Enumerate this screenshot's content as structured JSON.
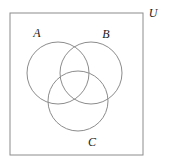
{
  "figure": {
    "kind": "venn-diagram",
    "background_color": "#ffffff",
    "stroke_color": "#8c8c8c",
    "label_color": "#1a1a1a",
    "stroke_width": 1
  },
  "universe": {
    "label": "U",
    "label_x": 153,
    "label_y": 17,
    "rect": {
      "x": 10,
      "y": 13,
      "width": 133,
      "height": 142
    }
  },
  "sets": [
    {
      "name": "A",
      "label": "A",
      "label_x": 37,
      "label_y": 37,
      "circle": {
        "cx": 58,
        "cy": 73,
        "r": 31
      }
    },
    {
      "name": "B",
      "label": "B",
      "label_x": 106,
      "label_y": 38,
      "circle": {
        "cx": 91,
        "cy": 73,
        "r": 31
      }
    },
    {
      "name": "C",
      "label": "C",
      "label_x": 92,
      "label_y": 146,
      "circle": {
        "cx": 78,
        "cy": 101,
        "r": 30
      }
    }
  ]
}
